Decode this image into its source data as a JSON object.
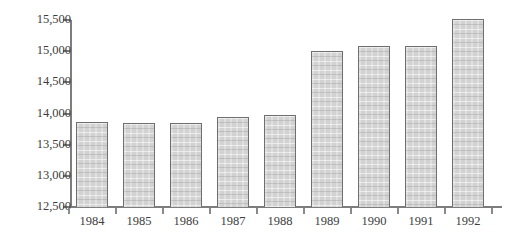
{
  "caption_fragment": "",
  "chart_data": {
    "type": "bar",
    "title": "",
    "subtitle": "",
    "xlabel": "",
    "ylabel": "",
    "categories": [
      "1984",
      "1985",
      "1986",
      "1987",
      "1988",
      "1989",
      "1990",
      "1991",
      "1992"
    ],
    "values": [
      13860,
      13840,
      13845,
      13940,
      13970,
      15010,
      15090,
      15090,
      15520
    ],
    "series": [
      {
        "name": "",
        "values": [
          13860,
          13840,
          13845,
          13940,
          13970,
          15010,
          15090,
          15090,
          15520
        ]
      }
    ],
    "ylim": [
      12500,
      15500
    ],
    "ytick_values": [
      12500,
      13000,
      13500,
      14000,
      14500,
      15000,
      15500
    ],
    "ytick_labels": [
      "12,500",
      "13,000",
      "13,500",
      "14,000",
      "14,500",
      "15,000",
      "15,500"
    ],
    "xtick_labels": [
      "1984",
      "1985",
      "1986",
      "1987",
      "1988",
      "1989",
      "1990",
      "1991",
      "1992"
    ],
    "grid": false,
    "legend": null,
    "legend_position": "none",
    "annotations": [],
    "colors": {
      "bar_fill": "#d2d2d2",
      "bar_border": "#6f6f6f",
      "axis": "#7d7d7d",
      "text": "#3d3d3d",
      "background": "#ffffff"
    }
  }
}
